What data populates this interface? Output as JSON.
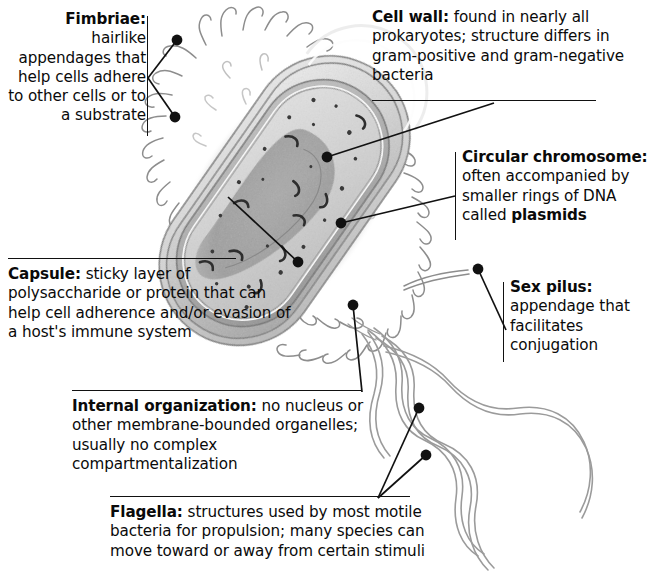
{
  "figure": {
    "style": "grayscale textbook illustration, rod-shaped bacterium with fimbriae, sex pilus and flagella"
  },
  "callouts": [
    {
      "id": "fimbriae",
      "title": "Fimbriae:",
      "body": " hairlike appendages that help cells adhere to other cells or to a substrate",
      "full_text": "Fimbriae: hairlike appendages that help cells adhere to other cells or to a substrate",
      "align": "right",
      "leader": "vertical-bar-right-two-dots"
    },
    {
      "id": "cell_wall",
      "title": "Cell wall:",
      "body": " found in nearly all prokaryotes; structure differs in gram-positive and gram-negative bacteria",
      "full_text": "Cell wall: found in nearly all prokaryotes; structure differs in gram-positive and gram-negative bacteria",
      "align": "left",
      "leader": "underline-below-one-dot"
    },
    {
      "id": "circular_chromosome",
      "title": "Circular chromosome:",
      "body": " often accompanied by smaller rings of DNA called ",
      "emphasis": "plasmids",
      "full_text": "Circular chromosome: often accompanied by smaller rings of DNA called plasmids",
      "align": "left",
      "leader": "vertical-bar-left-one-dot"
    },
    {
      "id": "sex_pilus",
      "title": "Sex pilus:",
      "body": " appendage that facilitates conjugation",
      "full_text": "Sex pilus: appendage that facilitates conjugation",
      "align": "left",
      "leader": "vertical-bar-left-one-dot"
    },
    {
      "id": "capsule",
      "title": "Capsule:",
      "body": " sticky layer of polysaccharide or protein that can help cell adherence and/or evasion of a host's immune system",
      "full_text": "Capsule: sticky layer of polysaccharide or protein that can help cell adherence and/or evasion of a host's immune system",
      "align": "left",
      "leader": "overline-above-one-dot"
    },
    {
      "id": "internal_organization",
      "title": "Internal organization:",
      "body": " no nucleus or other membrane-bounded organelles; usually no complex compartmentalization",
      "full_text": "Internal organization: no nucleus or other membrane-bounded organelles; usually no complex compartmentalization",
      "align": "left",
      "leader": "overline-above-one-dot"
    },
    {
      "id": "flagella",
      "title": "Flagella:",
      "body": " structures used by most motile bacteria for propulsion; many species can move toward or away from certain stimuli",
      "full_text": "Flagella: structures used by most motile bacteria for propulsion; many species can move toward or away from certain stimuli",
      "align": "left",
      "leader": "overline-above-two-dots"
    }
  ],
  "colors": {
    "background": "#ffffff",
    "text": "#0a0a0a",
    "leader_line": "#111111",
    "cell_outline": "#6a6a6a",
    "capsule_fill": "#d8d8d8",
    "cell_wall_fill": "#a9a9a9",
    "cytoplasm_fill": "#c9c9c9",
    "nucleoid_fill": "#9a9a9a",
    "appendage": "#8a8a8a"
  }
}
